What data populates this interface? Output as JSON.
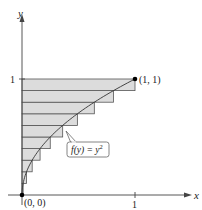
{
  "diagram": {
    "axes": {
      "x_label": "x",
      "y_label": "y",
      "x_tick_label": "1",
      "y_tick_label": "1"
    },
    "points": [
      {
        "label": "(0, 0)",
        "x": 0,
        "y": 0
      },
      {
        "label": "(1, 1)",
        "x": 1,
        "y": 1
      }
    ],
    "curve": {
      "function_label_prefix": "f(y) = y",
      "function_label_exponent": "2",
      "description": "x = y^2 for 0 <= y <= 1"
    },
    "rectangles": {
      "count": 10,
      "orientation": "horizontal",
      "rule": "right endpoint (width = f(y_top))",
      "fill": "#dcdcdc",
      "stroke": "#555555"
    },
    "colors": {
      "axis": "#444444",
      "curve": "#333333",
      "point": "#000000",
      "label_box": "#666666"
    }
  }
}
